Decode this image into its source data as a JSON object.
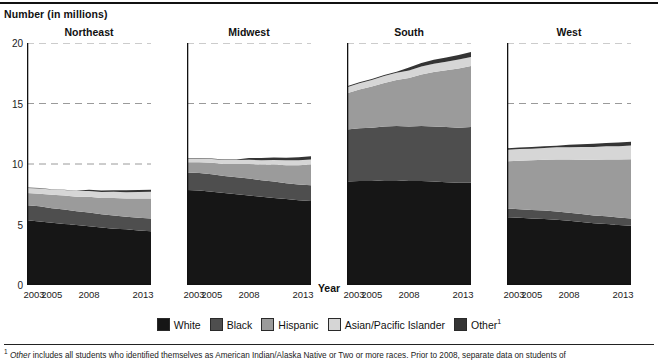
{
  "header": {
    "y_axis_title": "Number (in millions)",
    "x_axis_title": "Year"
  },
  "footnote": {
    "marker": "1",
    "lead_italic": "Other",
    "text": " includes all students who identified themselves as American Indian/Alaska Native or Two or more races. Prior to 2008, separate data on students of"
  },
  "legend": {
    "items": [
      {
        "label": "White",
        "color": "#161616"
      },
      {
        "label": "Black",
        "color": "#4e4e4e"
      },
      {
        "label": "Hispanic",
        "color": "#9b9b9b"
      },
      {
        "label": "Asian/Pacific Islander",
        "color": "#d6d6d6"
      },
      {
        "label": "Other",
        "color": "#343434",
        "sup": "1"
      }
    ]
  },
  "chart_data": {
    "type": "area",
    "xlabel": "Year",
    "ylabel": "Number (in millions)",
    "ylim": [
      0,
      20
    ],
    "yticks": [
      0,
      5,
      10,
      15,
      20
    ],
    "xlim": [
      2003,
      2013
    ],
    "xticks": [
      2003,
      2005,
      2008,
      2013
    ],
    "x": [
      2003,
      2004,
      2005,
      2006,
      2007,
      2008,
      2009,
      2010,
      2011,
      2012,
      2013
    ],
    "grid": "horizontal-dashed",
    "legend_position": "bottom",
    "stacked": true,
    "series_order": [
      "White",
      "Black",
      "Hispanic",
      "Asian/Pacific Islander",
      "Other"
    ],
    "panels": [
      {
        "name": "Northeast",
        "series": [
          {
            "name": "White",
            "values": [
              5.35,
              5.25,
              5.15,
              5.05,
              4.95,
              4.85,
              4.75,
              4.65,
              4.6,
              4.5,
              4.45
            ]
          },
          {
            "name": "Black",
            "values": [
              1.25,
              1.25,
              1.2,
              1.2,
              1.15,
              1.15,
              1.1,
              1.1,
              1.05,
              1.05,
              1.05
            ]
          },
          {
            "name": "Hispanic",
            "values": [
              1.0,
              1.05,
              1.1,
              1.15,
              1.2,
              1.3,
              1.35,
              1.45,
              1.5,
              1.6,
              1.65
            ]
          },
          {
            "name": "Asian/Pacific Islander",
            "values": [
              0.42,
              0.43,
              0.44,
              0.45,
              0.46,
              0.47,
              0.48,
              0.5,
              0.52,
              0.53,
              0.55
            ]
          },
          {
            "name": "Other",
            "values": [
              0.03,
              0.03,
              0.03,
              0.03,
              0.03,
              0.1,
              0.12,
              0.14,
              0.16,
              0.17,
              0.18
            ]
          }
        ],
        "totals": [
          8.05,
          8.01,
          7.92,
          7.88,
          7.79,
          7.87,
          7.8,
          7.84,
          7.83,
          7.85,
          7.88
        ]
      },
      {
        "name": "Midwest",
        "series": [
          {
            "name": "White",
            "values": [
              7.85,
              7.8,
              7.7,
              7.6,
              7.5,
              7.4,
              7.3,
              7.2,
              7.1,
              7.0,
              6.95
            ]
          },
          {
            "name": "Black",
            "values": [
              1.45,
              1.45,
              1.45,
              1.4,
              1.4,
              1.4,
              1.35,
              1.35,
              1.3,
              1.3,
              1.3
            ]
          },
          {
            "name": "Hispanic",
            "values": [
              0.85,
              0.9,
              0.95,
              1.0,
              1.1,
              1.2,
              1.3,
              1.4,
              1.5,
              1.6,
              1.7
            ]
          },
          {
            "name": "Asian/Pacific Islander",
            "values": [
              0.3,
              0.31,
              0.32,
              0.33,
              0.34,
              0.35,
              0.36,
              0.38,
              0.4,
              0.41,
              0.43
            ]
          },
          {
            "name": "Other",
            "values": [
              0.04,
              0.04,
              0.04,
              0.04,
              0.04,
              0.15,
              0.18,
              0.2,
              0.22,
              0.24,
              0.26
            ]
          }
        ],
        "totals": [
          10.49,
          10.5,
          10.46,
          10.37,
          10.38,
          10.5,
          10.49,
          10.53,
          10.52,
          10.55,
          10.64
        ]
      },
      {
        "name": "South",
        "series": [
          {
            "name": "White",
            "values": [
              8.55,
              8.6,
              8.6,
              8.65,
              8.65,
              8.6,
              8.6,
              8.55,
              8.5,
              8.45,
              8.45
            ]
          },
          {
            "name": "Black",
            "values": [
              4.3,
              4.35,
              4.4,
              4.45,
              4.5,
              4.5,
              4.55,
              4.55,
              4.55,
              4.55,
              4.6
            ]
          },
          {
            "name": "Hispanic",
            "values": [
              3.0,
              3.2,
              3.4,
              3.6,
              3.8,
              4.0,
              4.25,
              4.5,
              4.7,
              4.9,
              5.05
            ]
          },
          {
            "name": "Asian/Pacific Islander",
            "values": [
              0.5,
              0.52,
              0.55,
              0.58,
              0.6,
              0.62,
              0.65,
              0.68,
              0.7,
              0.73,
              0.75
            ]
          },
          {
            "name": "Other",
            "values": [
              0.08,
              0.08,
              0.08,
              0.08,
              0.08,
              0.25,
              0.3,
              0.34,
              0.36,
              0.38,
              0.4
            ]
          }
        ],
        "totals": [
          16.43,
          16.75,
          17.03,
          17.36,
          17.63,
          17.97,
          18.35,
          18.62,
          18.81,
          19.01,
          19.25
        ]
      },
      {
        "name": "West",
        "series": [
          {
            "name": "White",
            "values": [
              5.6,
              5.55,
              5.5,
              5.45,
              5.4,
              5.3,
              5.2,
              5.1,
              5.05,
              4.95,
              4.9
            ]
          },
          {
            "name": "Black",
            "values": [
              0.72,
              0.72,
              0.7,
              0.7,
              0.68,
              0.67,
              0.66,
              0.65,
              0.63,
              0.62,
              0.6
            ]
          },
          {
            "name": "Hispanic",
            "values": [
              3.9,
              4.0,
              4.1,
              4.2,
              4.3,
              4.4,
              4.5,
              4.6,
              4.7,
              4.8,
              4.9
            ]
          },
          {
            "name": "Asian/Pacific Islander",
            "values": [
              0.95,
              0.96,
              0.97,
              0.98,
              1.0,
              1.02,
              1.04,
              1.06,
              1.08,
              1.1,
              1.12
            ]
          },
          {
            "name": "Other",
            "values": [
              0.13,
              0.13,
              0.13,
              0.13,
              0.13,
              0.2,
              0.24,
              0.26,
              0.28,
              0.3,
              0.32
            ]
          }
        ],
        "totals": [
          11.3,
          11.36,
          11.4,
          11.46,
          11.51,
          11.59,
          11.64,
          11.67,
          11.74,
          11.77,
          11.84
        ]
      }
    ]
  }
}
